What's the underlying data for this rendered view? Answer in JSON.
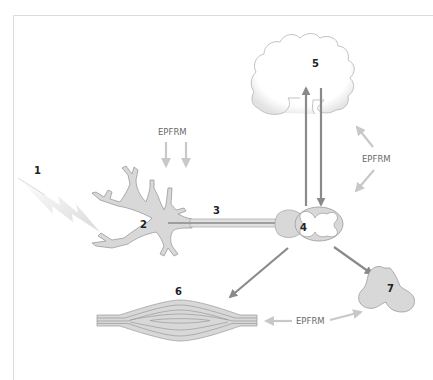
{
  "diagram": {
    "labels": {
      "n1": "1",
      "n2": "2",
      "n3": "3",
      "n4": "4",
      "n5": "5",
      "n6": "6",
      "n7": "7",
      "epfrm_top": "EPFRM",
      "epfrm_right": "EPFRM",
      "epfrm_bottom": "EPFRM"
    },
    "components": [
      {
        "id": "1",
        "depicts": "stimulus"
      },
      {
        "id": "2",
        "depicts": "sensory-neuron-dendrites"
      },
      {
        "id": "3",
        "depicts": "axon"
      },
      {
        "id": "4",
        "depicts": "spinal-cord-cross-section"
      },
      {
        "id": "5",
        "depicts": "brain"
      },
      {
        "id": "6",
        "depicts": "muscle"
      },
      {
        "id": "7",
        "depicts": "gland"
      }
    ],
    "colors": {
      "frame": "#dcdcdc",
      "tissue_fill": "#d8d8d8",
      "tissue_stroke": "#9a9a9a",
      "dark_arrow": "#8a8a8a",
      "light_arrow": "#c8c8c8",
      "label_text": "#6a6a6a",
      "number_text": "#222222"
    }
  }
}
